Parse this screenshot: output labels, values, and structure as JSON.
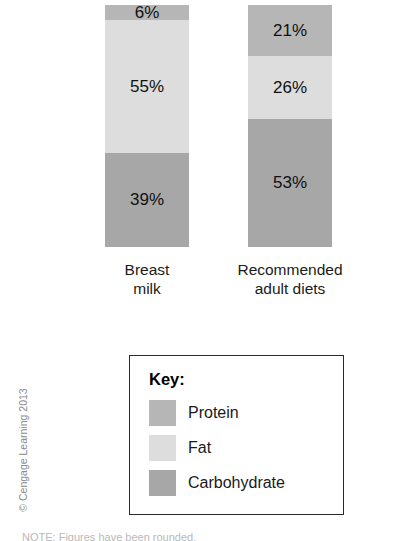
{
  "chart_data": {
    "type": "bar",
    "subtype": "stacked-percentage",
    "title": "",
    "xlabel": "",
    "ylabel": "",
    "ylim": [
      0,
      100
    ],
    "grid": false,
    "legend_position": "below-center",
    "categories": [
      "Breast milk",
      "Recommended adult diets"
    ],
    "series": [
      {
        "name": "Protein",
        "color": "#b6b6b6",
        "values": [
          6,
          21
        ],
        "value_labels": [
          "6%",
          "21%"
        ]
      },
      {
        "name": "Fat",
        "color": "#dddddd",
        "values": [
          55,
          26
        ],
        "value_labels": [
          "55%",
          "26%"
        ]
      },
      {
        "name": "Carbohydrate",
        "color": "#a7a7a7",
        "values": [
          39,
          53
        ],
        "value_labels": [
          "39%",
          "53%"
        ]
      }
    ],
    "bars": [
      {
        "caption_line1": "Breast",
        "caption_line2": "milk",
        "segments": [
          {
            "name": "Protein",
            "label": "6%",
            "value": 6,
            "color": "#b6b6b6"
          },
          {
            "name": "Fat",
            "label": "55%",
            "value": 55,
            "color": "#dddddd"
          },
          {
            "name": "Carbohydrate",
            "label": "39%",
            "value": 39,
            "color": "#a7a7a7"
          }
        ]
      },
      {
        "caption_line1": "Recommended",
        "caption_line2": "adult diets",
        "segments": [
          {
            "name": "Protein",
            "label": "21%",
            "value": 21,
            "color": "#b6b6b6"
          },
          {
            "name": "Fat",
            "label": "26%",
            "value": 26,
            "color": "#dddddd"
          },
          {
            "name": "Carbohydrate",
            "label": "53%",
            "value": 53,
            "color": "#a7a7a7"
          }
        ]
      }
    ]
  },
  "legend": {
    "title": "Key:",
    "items": [
      {
        "label": "Protein",
        "color": "#b6b6b6"
      },
      {
        "label": "Fat",
        "color": "#dddddd"
      },
      {
        "label": "Carbohydrate",
        "color": "#a7a7a7"
      }
    ]
  },
  "copyright": "© Cengage Learning 2013",
  "bottom_note": "NOTE: Figures have been rounded."
}
